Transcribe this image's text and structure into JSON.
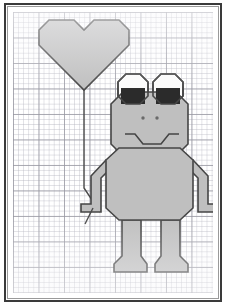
{
  "artwork": {
    "title": "Frog Holding a Heart Balloon",
    "medium": "Grid paper coordinate drawing",
    "surface_label": "graph-paper",
    "frame_label": "picture-frame"
  },
  "palette": {
    "paper": "#ffffff",
    "grid_minor": "#bababa",
    "grid_major": "#9696a0",
    "figure_fill": "#bfbfbf",
    "figure_outline": "#454545",
    "eye_white": "#fbfbfb",
    "pupil": "#2b2b2b",
    "frame_border": "#3a3a3a",
    "frame_inner_rule": "#9a9a9a",
    "string": "#4a4a4a"
  },
  "grid": {
    "minor_cell_px": 5.1,
    "major_cell_px": 25.5,
    "minor_per_major": 5,
    "columns": 39,
    "rows": 55
  },
  "figures": {
    "balloon": {
      "name": "heart-balloon",
      "shape": "heart",
      "fill": "#bfbfbf",
      "points": "26,18 36,8 61,8 71,18 81,8 106,8 116,18 116,33 71,78 26,33",
      "string_path": "M 71,78 L 71,176 L 87,200"
    },
    "frog": {
      "name": "frog-figure",
      "head": {
        "name": "frog-head",
        "points": "98,92 110,80 163,80 175,92 175,132 163,144 110,144 98,132"
      },
      "eye_left": {
        "name": "frog-left-eye",
        "points": "105,70 113,62 127,62 135,70 135,84 127,92 113,92 105,84",
        "pupil": "108,76 132,76 132,92 108,92"
      },
      "eye_right": {
        "name": "frog-right-eye",
        "points": "140,70 148,62 162,62 170,70 170,84 162,92 148,92 140,84",
        "pupil": "143,76 167,76 167,92 143,92"
      },
      "nostril_left": {
        "name": "frog-left-nostril",
        "cx": 130,
        "cy": 106,
        "r": 1.7
      },
      "nostril_right": {
        "name": "frog-right-nostril",
        "cx": 144,
        "cy": 106,
        "r": 1.7
      },
      "mouth": {
        "name": "frog-mouth-smile",
        "path": "M 112,122 L 122,122 L 130,132 L 148,132 L 156,122 L 166,122"
      },
      "body": {
        "name": "frog-body",
        "points": "93,148 106,136 167,136 180,148 180,196 167,208 106,208 93,196"
      },
      "arm_left": {
        "name": "frog-left-arm",
        "points": "93,148 78,164 78,192 68,192 68,200 88,200 88,166 100,154"
      },
      "arm_right": {
        "name": "frog-right-arm",
        "points": "180,148 195,164 195,192 205,192 205,200 185,200 185,166 173,154"
      },
      "leg_left": {
        "name": "frog-left-leg",
        "points": "109,208 128,208 128,244 134,252 134,260 101,260 101,252 109,244"
      },
      "leg_right": {
        "name": "frog-right-leg",
        "points": "148,208 167,208 167,244 175,252 175,260 142,260 142,252 148,244"
      },
      "hand_tail": {
        "name": "frog-hand-string-tail",
        "path": "M 80,196 L 72,212"
      }
    }
  }
}
